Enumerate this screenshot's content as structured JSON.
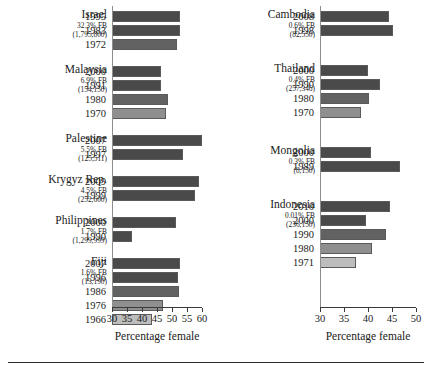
{
  "figure": {
    "axis_title_left": "Percentage female",
    "axis_title_right": "Percentage female"
  },
  "chart_data": {
    "type": "bar",
    "title": "",
    "xlabel": "Percentage female",
    "ylabel": "",
    "orientation": "horizontal",
    "grid": false,
    "legend": false,
    "panels": [
      {
        "name": "left-panel",
        "xlim": [
          30,
          60
        ],
        "xticks": [
          30,
          35,
          40,
          45,
          50,
          55,
          60
        ],
        "xtick_labels": [
          "30",
          "35",
          "40",
          "45",
          "50",
          "55",
          "60"
        ],
        "xlabel": "Percentage female",
        "groups": [
          {
            "country": "Israel",
            "fb_percent": "32.3% FB",
            "fb_count": "(1,795,800)",
            "categories": [
              "1995",
              "1983",
              "1972"
            ],
            "values": [
              52.6,
              52.6,
              51.6
            ]
          },
          {
            "country": "Malaysia",
            "fb_percent": "6.9% FB",
            "fb_count": "(154,150)",
            "categories": [
              "2000",
              "1991",
              "1980",
              "1970"
            ],
            "values": [
              46.3,
              46.3,
              48.7,
              48.0
            ]
          },
          {
            "country": "Palestine",
            "fb_percent": "5.5% FB",
            "fb_count": "(125,511)",
            "categories": [
              "2007",
              "1997"
            ],
            "values": [
              60.0,
              53.7
            ]
          },
          {
            "country": "Krygyz Rep.",
            "fb_percent": "4.5% FB",
            "fb_count": "(252,600)",
            "categories": [
              "2009",
              "1999"
            ],
            "values": [
              59.0,
              57.7
            ]
          },
          {
            "country": "Philippines",
            "fb_percent": "1.7% FB",
            "fb_count": "(1,299,999)",
            "categories": [
              "2000",
              "1990"
            ],
            "values": [
              51.3,
              36.7
            ]
          },
          {
            "country": "Fiji",
            "fb_percent": "1.6% FB",
            "fb_count": "(13,190)",
            "categories": [
              "2007",
              "1996",
              "1986",
              "1976",
              "1966"
            ],
            "values": [
              52.7,
              52.0,
              52.3,
              47.0,
              43.3
            ]
          }
        ]
      },
      {
        "name": "right-panel",
        "xlim": [
          30,
          50
        ],
        "xticks": [
          30,
          35,
          40,
          45,
          50
        ],
        "xtick_labels": [
          "30",
          "35",
          "40",
          "45",
          "50"
        ],
        "xlabel": "Percentage female",
        "groups": [
          {
            "country": "Cambodia",
            "fb_percent": "0.6% FB",
            "fb_count": "(82,550)",
            "categories": [
              "2008",
              "1998"
            ],
            "values": [
              44.4,
              45.2
            ]
          },
          {
            "country": "Thailand",
            "fb_percent": "0.4% FB",
            "fb_count": "(257,346)",
            "categories": [
              "2000",
              "1990",
              "1980",
              "1970"
            ],
            "values": [
              40.0,
              42.5,
              40.2,
              38.5
            ]
          },
          {
            "country": "Mongolia",
            "fb_percent": "0.3% FB",
            "fb_count": "(8,150)",
            "categories": [
              "2000",
              "1989"
            ],
            "values": [
              40.6,
              46.7
            ]
          },
          {
            "country": "Indonesia",
            "fb_percent": "0.01% FB",
            "fb_count": "(236,150)",
            "categories": [
              "2010",
              "2000",
              "1990",
              "1980",
              "1971"
            ],
            "values": [
              44.6,
              39.6,
              43.8,
              40.9,
              37.5
            ]
          }
        ]
      }
    ]
  }
}
